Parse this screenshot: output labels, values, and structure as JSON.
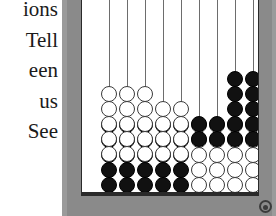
{
  "figure": {
    "kind": "abacus-illustration",
    "caption_side_text": {
      "lines": [
        "ions",
        "Tell",
        "een",
        "us",
        "See"
      ]
    },
    "corner_mark": "page-corner-mark"
  },
  "colors": {
    "frame": "#8a8a8a",
    "board_background": "#ffffff",
    "board_outline": "#2a2a2a",
    "bead_black": "#111111",
    "bead_white": "#ffffff",
    "bead_outline": "#3a3a3a",
    "wire": "#6d6d6d",
    "page_background": "#ffffff",
    "text": "#1b1b1b"
  },
  "abacus": {
    "rod_count": 10,
    "beads_per_rod": 10,
    "bead_diameter_px": 16,
    "rod_x_positions": [
      27,
      45,
      63,
      81,
      99,
      117,
      135,
      153,
      171,
      189
    ],
    "rods": [
      {
        "index": 1,
        "label": "rod-1",
        "top_group_color": "white",
        "top_group_count": 5,
        "bottom_group_color": "black",
        "bottom_group_count": 5,
        "top_group_start_y": 99
      },
      {
        "index": 2,
        "label": "rod-2",
        "top_group_color": "white",
        "top_group_count": 5,
        "bottom_group_color": "black",
        "bottom_group_count": 5,
        "top_group_start_y": 99
      },
      {
        "index": 3,
        "label": "rod-3",
        "top_group_color": "white",
        "top_group_count": 5,
        "bottom_group_color": "black",
        "bottom_group_count": 5,
        "top_group_start_y": 99
      },
      {
        "index": 4,
        "label": "rod-4",
        "top_group_color": "white",
        "top_group_count": 4,
        "bottom_group_color": "black",
        "bottom_group_count": 5,
        "top_group_start_y": 114
      },
      {
        "index": 5,
        "label": "rod-5",
        "top_group_color": "white",
        "top_group_count": 4,
        "bottom_group_color": "black",
        "bottom_group_count": 5,
        "top_group_start_y": 114
      },
      {
        "index": 6,
        "label": "rod-6",
        "top_group_color": "black",
        "top_group_count": 2,
        "bottom_group_color": "white",
        "bottom_group_count": 5,
        "top_group_start_y": 129
      },
      {
        "index": 7,
        "label": "rod-7",
        "top_group_color": "black",
        "top_group_count": 2,
        "bottom_group_color": "white",
        "bottom_group_count": 5,
        "top_group_start_y": 129
      },
      {
        "index": 8,
        "label": "rod-8",
        "top_group_color": "black",
        "top_group_count": 5,
        "bottom_group_color": "white",
        "bottom_group_count": 5,
        "top_group_start_y": 84
      },
      {
        "index": 9,
        "label": "rod-9",
        "top_group_color": "black",
        "top_group_count": 5,
        "bottom_group_color": "white",
        "bottom_group_count": 5,
        "top_group_start_y": 84
      },
      {
        "index": 10,
        "label": "rod-10",
        "top_group_color": "black",
        "top_group_count": 5,
        "bottom_group_color": "white",
        "bottom_group_count": 5,
        "top_group_start_y": 84
      }
    ]
  }
}
